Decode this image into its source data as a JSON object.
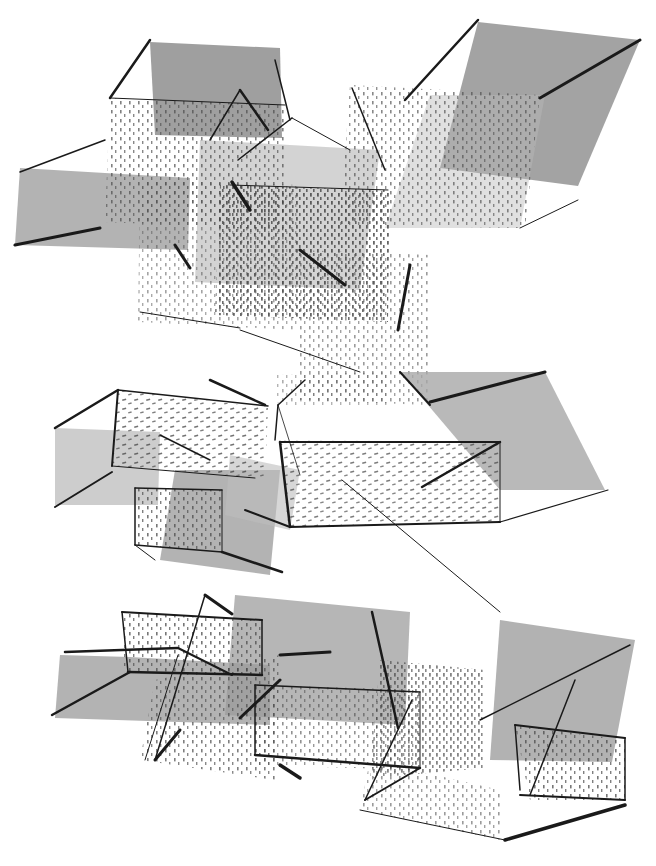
{
  "artwork": {
    "subject": "abstract drawing of transparent stippled cubes and planes with gray washes",
    "colors": {
      "paper": "#ffffff",
      "wash_dark": "#8e8e8e",
      "wash_mid": "#a8a8a8",
      "wash_light": "#c4c4c4",
      "ink": "#1a1a1a",
      "stipple": "#4a4a4a"
    },
    "groups": [
      "top-cluster",
      "middle-cluster",
      "bottom-cluster"
    ]
  }
}
